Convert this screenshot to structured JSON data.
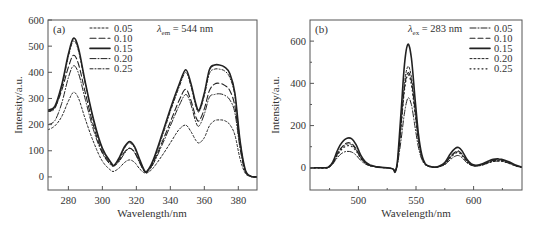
{
  "chart_data": [
    {
      "type": "line",
      "panel": "(a)",
      "annotation": {
        "lambda_symbol": "λ",
        "subscript": "em",
        "text": " = 544 nm"
      },
      "xlabel": "Wavelength/nm",
      "ylabel": "Intensity/a.u.",
      "xlim": [
        268,
        391
      ],
      "ylim": [
        -50,
        600
      ],
      "xticks": [
        280,
        300,
        320,
        340,
        360,
        380
      ],
      "yticks": [
        0,
        100,
        200,
        300,
        400,
        500,
        600
      ],
      "legend_position": "upper-left",
      "x": [
        268,
        272,
        276,
        280,
        283,
        286,
        290,
        295,
        300,
        305,
        307,
        310,
        313,
        316,
        319,
        322,
        325,
        327,
        330,
        335,
        340,
        345,
        349,
        352,
        355,
        357,
        360,
        363,
        366,
        369,
        372,
        375,
        378,
        381,
        384,
        387,
        391
      ],
      "series": [
        {
          "name": "0.05",
          "dash": "2,2",
          "width": 1,
          "values": [
            180,
            195,
            230,
            290,
            323,
            300,
            220,
            130,
            60,
            25,
            22,
            35,
            55,
            65,
            55,
            30,
            15,
            18,
            35,
            80,
            130,
            180,
            198,
            175,
            140,
            130,
            150,
            195,
            215,
            218,
            215,
            200,
            160,
            70,
            15,
            2,
            0
          ]
        },
        {
          "name": "0.10",
          "dash": "6,3",
          "width": 1.1,
          "values": [
            250,
            265,
            330,
            420,
            465,
            430,
            320,
            190,
            95,
            50,
            45,
            65,
            95,
            110,
            95,
            55,
            20,
            25,
            55,
            130,
            210,
            290,
            335,
            295,
            230,
            215,
            260,
            330,
            355,
            358,
            350,
            330,
            270,
            120,
            25,
            3,
            0
          ]
        },
        {
          "name": "0.15",
          "dash": "none",
          "width": 1.6,
          "values": [
            255,
            270,
            350,
            470,
            530,
            490,
            360,
            215,
            110,
            55,
            45,
            75,
            115,
            135,
            115,
            65,
            22,
            28,
            65,
            160,
            260,
            350,
            410,
            360,
            280,
            255,
            320,
            410,
            428,
            428,
            420,
            395,
            320,
            140,
            30,
            3,
            0
          ]
        },
        {
          "name": "0.20",
          "dash": "6,2,1,2",
          "width": 1,
          "values": [
            200,
            215,
            280,
            380,
            425,
            395,
            295,
            175,
            90,
            45,
            42,
            60,
            90,
            110,
            92,
            52,
            18,
            22,
            50,
            120,
            195,
            270,
            315,
            280,
            210,
            195,
            240,
            305,
            315,
            318,
            312,
            295,
            245,
            110,
            22,
            3,
            0
          ]
        },
        {
          "name": "0.25",
          "dash": "3,2,1,2",
          "width": 1,
          "values": [
            250,
            262,
            340,
            460,
            520,
            480,
            355,
            210,
            105,
            52,
            45,
            70,
            110,
            130,
            110,
            62,
            20,
            26,
            62,
            150,
            250,
            340,
            400,
            350,
            270,
            250,
            310,
            395,
            412,
            412,
            405,
            380,
            310,
            135,
            28,
            3,
            0
          ]
        }
      ]
    },
    {
      "type": "line",
      "panel": "(b)",
      "annotation": {
        "lambda_symbol": "λ",
        "subscript": "ex",
        "text": " = 283 nm"
      },
      "xlabel": "Wavelength/nm",
      "ylabel": "Intensity/a.u.",
      "xlim": [
        458,
        642
      ],
      "ylim": [
        -105,
        700
      ],
      "xticks": [
        500,
        550,
        600
      ],
      "xminor": [
        475,
        525,
        575,
        625
      ],
      "yticks": [
        0,
        200,
        400,
        600
      ],
      "yminor": [
        100,
        300,
        500
      ],
      "legend_position": "upper-right",
      "x": [
        458,
        465,
        470,
        474,
        478,
        482,
        486,
        490,
        494,
        498,
        502,
        506,
        510,
        515,
        520,
        525,
        530,
        532,
        534,
        537,
        540,
        543,
        546,
        549,
        552,
        555,
        558,
        562,
        566,
        570,
        575,
        580,
        584,
        587,
        590,
        594,
        598,
        602,
        607,
        612,
        617,
        622,
        627,
        632,
        637,
        642
      ],
      "series": [
        {
          "name": "0.05",
          "dash": "6,2,1,2",
          "width": 1,
          "values": [
            0,
            0,
            0,
            2,
            20,
            50,
            70,
            78,
            75,
            60,
            35,
            18,
            10,
            5,
            2,
            0,
            -5,
            -15,
            20,
            130,
            260,
            330,
            300,
            200,
            100,
            40,
            15,
            5,
            3,
            5,
            15,
            40,
            55,
            58,
            48,
            25,
            12,
            8,
            12,
            22,
            30,
            32,
            28,
            18,
            8,
            2
          ]
        },
        {
          "name": "0.10",
          "dash": "5,3",
          "width": 1.1,
          "values": [
            0,
            0,
            0,
            2,
            25,
            70,
            100,
            118,
            115,
            90,
            50,
            25,
            12,
            5,
            2,
            0,
            -5,
            -15,
            30,
            200,
            380,
            450,
            410,
            280,
            140,
            55,
            18,
            6,
            3,
            6,
            20,
            55,
            75,
            80,
            65,
            35,
            15,
            10,
            15,
            25,
            35,
            38,
            32,
            22,
            10,
            2
          ]
        },
        {
          "name": "0.15",
          "dash": "none",
          "width": 1.6,
          "values": [
            0,
            0,
            0,
            3,
            30,
            85,
            122,
            140,
            138,
            110,
            60,
            28,
            14,
            6,
            2,
            0,
            -5,
            -20,
            40,
            260,
            490,
            585,
            520,
            340,
            165,
            62,
            20,
            7,
            3,
            8,
            25,
            68,
            92,
            96,
            80,
            42,
            18,
            12,
            18,
            30,
            40,
            42,
            36,
            25,
            12,
            3
          ]
        },
        {
          "name": "0.20",
          "dash": "2,2",
          "width": 1,
          "values": [
            0,
            0,
            0,
            2,
            24,
            68,
            98,
            112,
            110,
            85,
            48,
            24,
            11,
            5,
            2,
            0,
            -5,
            -15,
            30,
            210,
            400,
            480,
            430,
            290,
            145,
            55,
            18,
            6,
            3,
            6,
            20,
            52,
            72,
            76,
            62,
            33,
            14,
            10,
            14,
            24,
            33,
            36,
            30,
            20,
            9,
            2
          ]
        },
        {
          "name": "0.25",
          "dash": "1,3",
          "width": 1.2,
          "values": [
            0,
            0,
            0,
            2,
            22,
            62,
            90,
            104,
            102,
            80,
            45,
            22,
            10,
            5,
            2,
            0,
            -5,
            -15,
            28,
            190,
            370,
            440,
            395,
            265,
            130,
            50,
            16,
            6,
            3,
            6,
            18,
            48,
            68,
            72,
            58,
            30,
            13,
            9,
            13,
            22,
            30,
            33,
            28,
            19,
            8,
            2
          ]
        }
      ]
    }
  ]
}
